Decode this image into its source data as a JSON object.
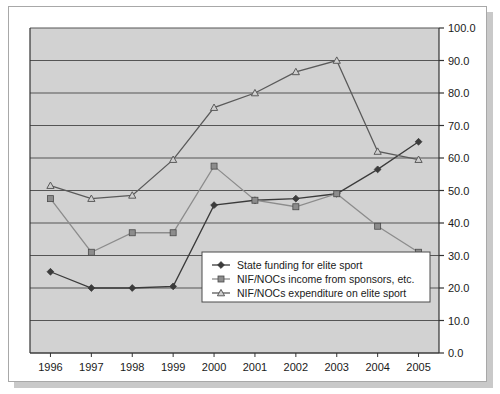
{
  "chart_data": {
    "type": "line",
    "title": "",
    "xlabel": "",
    "ylabel": "",
    "categories": [
      "1996",
      "1997",
      "1998",
      "1999",
      "2000",
      "2001",
      "2002",
      "2003",
      "2004",
      "2005"
    ],
    "x": [
      1996,
      1997,
      1998,
      1999,
      2000,
      2001,
      2002,
      2003,
      2004,
      2005
    ],
    "ylim": [
      0.0,
      100.0
    ],
    "ytick_step": 10.0,
    "ytick_labels": [
      "0.0",
      "10.0",
      "20.0",
      "30.0",
      "40.0",
      "50.0",
      "60.0",
      "70.0",
      "80.0",
      "90.0",
      "100.0"
    ],
    "ytick_values": [
      0.0,
      10.0,
      20.0,
      30.0,
      40.0,
      50.0,
      60.0,
      70.0,
      80.0,
      90.0,
      100.0
    ],
    "grid": true,
    "grid_axis": "y",
    "y_axis_position": "right",
    "legend_position": "inside-lower-center",
    "plot_background": "#d2d2d2",
    "series": [
      {
        "name": "State funding for elite sport",
        "marker": "diamond",
        "color": "#3b3b3b",
        "values": [
          25.0,
          20.0,
          20.0,
          20.5,
          45.5,
          47.0,
          47.5,
          49.0,
          56.5,
          65.0
        ]
      },
      {
        "name": "NIF/NOCs income from sponsors, etc.",
        "marker": "square",
        "color": "#8c8c8c",
        "values": [
          47.5,
          31.0,
          37.0,
          37.0,
          57.5,
          47.0,
          45.0,
          49.0,
          39.0,
          31.0
        ]
      },
      {
        "name": "NIF/NOCs expenditure on elite sport",
        "marker": "triangle",
        "color": "#5a5a5a",
        "values": [
          51.5,
          47.5,
          48.5,
          59.5,
          75.5,
          80.0,
          86.5,
          90.0,
          62.0,
          59.5
        ]
      }
    ]
  },
  "legend": {
    "items": [
      {
        "label": "State funding for elite sport",
        "marker": "diamond-icon"
      },
      {
        "label": "NIF/NOCs income from sponsors, etc.",
        "marker": "square-icon"
      },
      {
        "label": "NIF/NOCs expenditure on elite sport",
        "marker": "triangle-icon"
      }
    ]
  },
  "colors": {
    "series_1": "#3b3b3b",
    "series_2": "#8c8c8c",
    "series_3": "#5a5a5a",
    "plot_bg": "#d2d2d2",
    "gridline": "#555555",
    "axis": "#333333",
    "card_bg": "#ffffff"
  }
}
